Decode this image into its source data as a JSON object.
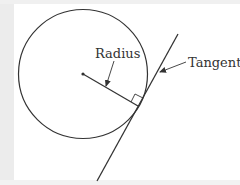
{
  "diagram": {
    "labels": {
      "radius": "Radius",
      "tangent": "Tangent"
    },
    "colors": {
      "stroke": "#333333",
      "background": "#ffffff",
      "edge": "#ececec"
    },
    "circle": {
      "cx": 83,
      "cy": 74,
      "r": 65
    },
    "center_point": {
      "x": 83,
      "y": 74
    },
    "radius_segment": {
      "x1": 83,
      "y1": 74,
      "x2": 138,
      "y2": 106
    },
    "tangent_line": {
      "x1": 178,
      "y1": 34,
      "x2": 97,
      "y2": 181
    },
    "right_angle_marker": "square at tangent point"
  }
}
